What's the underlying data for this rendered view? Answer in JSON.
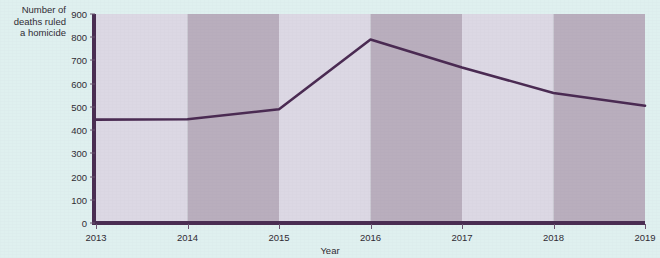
{
  "chart_data": {
    "type": "line",
    "title": "",
    "xlabel": "Year",
    "ylabel": "Number of deaths ruled a homicide",
    "categories": [
      "2013",
      "2014",
      "2015",
      "2016",
      "2017",
      "2018",
      "2019"
    ],
    "x": [
      2013,
      2014,
      2015,
      2016,
      2017,
      2018,
      2019
    ],
    "values": [
      445,
      447,
      490,
      790,
      670,
      560,
      505
    ],
    "series": [
      {
        "name": "Number of deaths ruled a homicide",
        "values": [
          445,
          447,
          490,
          790,
          670,
          560,
          505
        ]
      }
    ],
    "ylim": [
      0,
      900
    ],
    "xlim": [
      2013,
      2019
    ],
    "y_ticks": [
      0,
      100,
      200,
      300,
      400,
      500,
      600,
      700,
      800,
      900
    ],
    "y_tick_labels": [
      "0",
      "100",
      "200",
      "300",
      "400",
      "500",
      "600",
      "700",
      "800",
      "900"
    ],
    "x_ticks": [
      2013,
      2014,
      2015,
      2016,
      2017,
      2018,
      2019
    ],
    "x_tick_labels": [
      "2013",
      "2014",
      "2015",
      "2016",
      "2017",
      "2018",
      "2019"
    ],
    "grid": false,
    "legend": "none",
    "banded_background": true,
    "colors": {
      "line": "#4a2a52",
      "axis": "#4a2d52",
      "band_light": "#dcd8e4",
      "band_dark": "#b9aebd",
      "page_background": "#dff0ef",
      "tick_label": "#2f2b33"
    }
  },
  "axes": {
    "y_title_lines": [
      "Number of",
      "deaths ruled",
      "a homicide"
    ],
    "x_title": "Year"
  }
}
